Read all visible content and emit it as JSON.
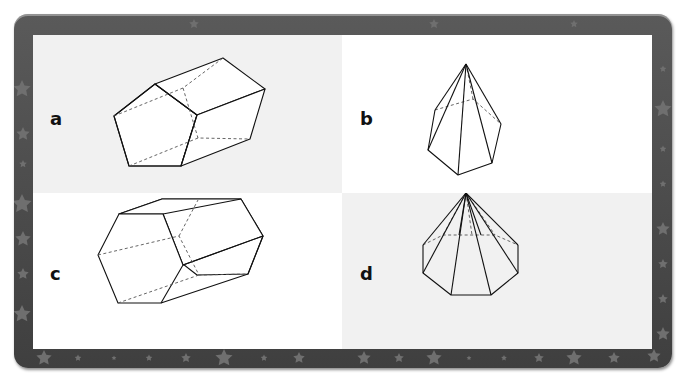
{
  "figure": {
    "frame_color": "#4a4a4a",
    "star_color": "#6e6e6e",
    "panels": [
      {
        "label": "a",
        "shape": "pentagonal-prism",
        "background": "#f1f1f1"
      },
      {
        "label": "b",
        "shape": "pentagonal-pyramid",
        "background": "#ffffff"
      },
      {
        "label": "c",
        "shape": "hexagonal-prism",
        "background": "#ffffff"
      },
      {
        "label": "d",
        "shape": "octagonal-pyramid",
        "background": "#f1f1f1"
      }
    ]
  }
}
